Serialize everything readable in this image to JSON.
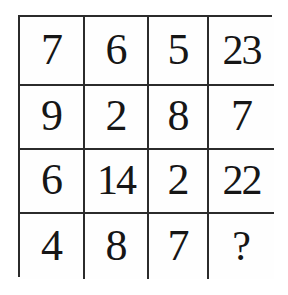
{
  "puzzle": {
    "type": "number-grid",
    "rows": 4,
    "columns": 4,
    "colors": {
      "grid_line": "#2b2b2b",
      "cell_background": "#fefefe",
      "text": "#161616",
      "page_background": "#ffffff"
    },
    "grid": [
      [
        {
          "value": "7",
          "unknown": false
        },
        {
          "value": "6",
          "unknown": false
        },
        {
          "value": "5",
          "unknown": false
        },
        {
          "value": "23",
          "unknown": false
        }
      ],
      [
        {
          "value": "9",
          "unknown": false
        },
        {
          "value": "2",
          "unknown": false
        },
        {
          "value": "8",
          "unknown": false
        },
        {
          "value": "7",
          "unknown": false
        }
      ],
      [
        {
          "value": "6",
          "unknown": false
        },
        {
          "value": "14",
          "unknown": false
        },
        {
          "value": "2",
          "unknown": false
        },
        {
          "value": "22",
          "unknown": false
        }
      ],
      [
        {
          "value": "4",
          "unknown": false
        },
        {
          "value": "8",
          "unknown": false
        },
        {
          "value": "7",
          "unknown": false
        },
        {
          "value": "?",
          "unknown": true
        }
      ]
    ]
  }
}
